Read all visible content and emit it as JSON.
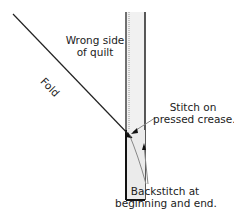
{
  "diagram": {
    "labels": {
      "wrong_side_line1": "Wrong side",
      "wrong_side_line2": "of quilt",
      "fold": "Fold",
      "stitch_line1": "Stitch on",
      "stitch_line2": "pressed crease.",
      "backstitch_line1": "Backstitch at",
      "backstitch_line2": "beginning and end."
    },
    "colors": {
      "line": "#222222",
      "strip_fill": "#f1f1f1",
      "arrow_line": "#888888"
    }
  }
}
